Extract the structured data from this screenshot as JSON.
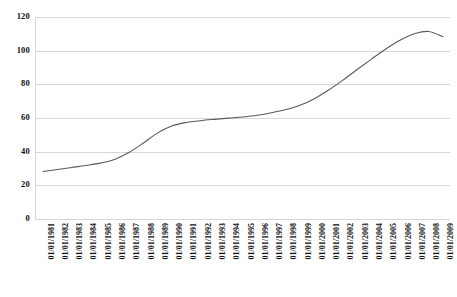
{
  "chart_data": {
    "type": "line",
    "title": "",
    "subtitle": "",
    "xlabel": "",
    "ylabel": "",
    "grid": "horizontal",
    "legend": "none",
    "ylim": [
      0,
      120
    ],
    "yticks": [
      "0",
      "20",
      "40",
      "60",
      "80",
      "100",
      "120"
    ],
    "ytick_values": [
      0,
      20,
      40,
      60,
      80,
      100,
      120
    ],
    "categories": [
      "01/01/1981",
      "01/01/1982",
      "01/01/1983",
      "01/01/1984",
      "01/01/1985",
      "01/01/1986",
      "01/01/1987",
      "01/01/1988",
      "01/01/1989",
      "01/01/1990",
      "01/01/1991",
      "01/01/1992",
      "01/01/1993",
      "01/01/1994",
      "01/01/1995",
      "01/01/1996",
      "01/01/1997",
      "01/01/1998",
      "01/01/1999",
      "01/01/2000",
      "01/01/2001",
      "01/01/2002",
      "01/01/2003",
      "01/01/2004",
      "01/01/2005",
      "01/01/2006",
      "01/01/2007",
      "01/01/2008",
      "01/01/2009"
    ],
    "series": [
      {
        "name": "Series 1",
        "color": "#595959",
        "values": [
          28.2,
          29.4,
          30.6,
          31.8,
          33.2,
          35.4,
          39.5,
          45.0,
          51.0,
          55.2,
          57.3,
          58.4,
          59.2,
          59.9,
          60.6,
          61.6,
          63.1,
          65.0,
          67.6,
          71.5,
          76.6,
          82.5,
          88.8,
          95.0,
          101.0,
          106.2,
          110.0,
          111.4,
          108.3
        ]
      }
    ],
    "colors": {
      "line": "#595959",
      "gridline": "#d6d6d6",
      "axis_text": "#111111",
      "background": "#ffffff"
    }
  }
}
